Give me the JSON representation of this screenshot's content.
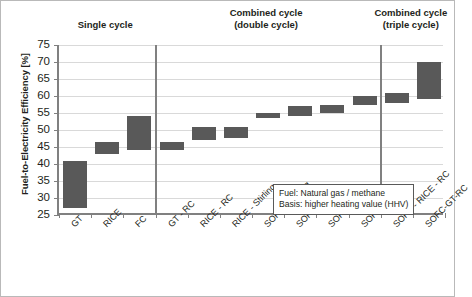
{
  "chart_data": {
    "type": "bar",
    "bar_style": "floating-range",
    "title": "",
    "xlabel": "",
    "ylabel": "Fuel-to-Electricity Efficiency [%]",
    "ylim": [
      25,
      75
    ],
    "ytick_step": 5,
    "yticks": [
      "75",
      "70",
      "65",
      "60",
      "55",
      "50",
      "45",
      "40",
      "35",
      "30",
      "25"
    ],
    "grid": true,
    "legend": "none",
    "categories": [
      "GT",
      "RICE",
      "FC",
      "GT - RC",
      "RICE - RC",
      "RICE - Stirling",
      "SOFC - Stirling",
      "SOFC - GT",
      "SOFC - RICE",
      "SOFC-RC",
      "SOFC - RICE - RC",
      "SOFC-GT-RC"
    ],
    "series": [
      {
        "name": "Efficiency range low",
        "values": [
          27,
          43,
          44,
          44,
          47,
          47.5,
          53.5,
          54,
          55,
          57.5,
          58,
          59
        ]
      },
      {
        "name": "Efficiency range high",
        "values": [
          41,
          46.5,
          54,
          46.5,
          51,
          51,
          55,
          57,
          57.5,
          60,
          61,
          70
        ]
      }
    ],
    "bars": [
      {
        "label": "GT",
        "group": "single",
        "low": 27,
        "high": 41
      },
      {
        "label": "RICE",
        "group": "single",
        "low": 43,
        "high": 46.5
      },
      {
        "label": "FC",
        "group": "single",
        "low": 44,
        "high": 54
      },
      {
        "label": "GT - RC",
        "group": "double",
        "low": 44,
        "high": 46.5
      },
      {
        "label": "RICE - RC",
        "group": "double",
        "low": 47,
        "high": 51
      },
      {
        "label": "RICE - Stirling",
        "group": "double",
        "low": 47.5,
        "high": 51
      },
      {
        "label": "SOFC - Stirling",
        "group": "double",
        "low": 53.5,
        "high": 55
      },
      {
        "label": "SOFC - GT",
        "group": "double",
        "low": 54,
        "high": 57
      },
      {
        "label": "SOFC - RICE",
        "group": "double",
        "low": 55,
        "high": 57.5
      },
      {
        "label": "SOFC-RC",
        "group": "double",
        "low": 57.5,
        "high": 60
      },
      {
        "label": "SOFC - RICE - RC",
        "group": "triple",
        "low": 58,
        "high": 61
      },
      {
        "label": "SOFC-GT-RC",
        "group": "triple",
        "low": 59,
        "high": 70
      }
    ],
    "sections": [
      {
        "id": "single",
        "line1": "Single cycle",
        "line2": ""
      },
      {
        "id": "double",
        "line1": "Combined cycle",
        "line2": "(double cycle)"
      },
      {
        "id": "triple",
        "line1": "Combined cycle",
        "line2": "(triple cycle)"
      }
    ],
    "annotation": {
      "line1": "Fuel: Natural gas / methane",
      "line2": "Basis: higher heating value (HHV)"
    },
    "colors": {
      "bar": "#595959",
      "axis": "#808080",
      "grid": "#d9d9d9",
      "text": "#231f20",
      "annotation_border": "#595959",
      "frame": "#b9b9b9"
    }
  }
}
